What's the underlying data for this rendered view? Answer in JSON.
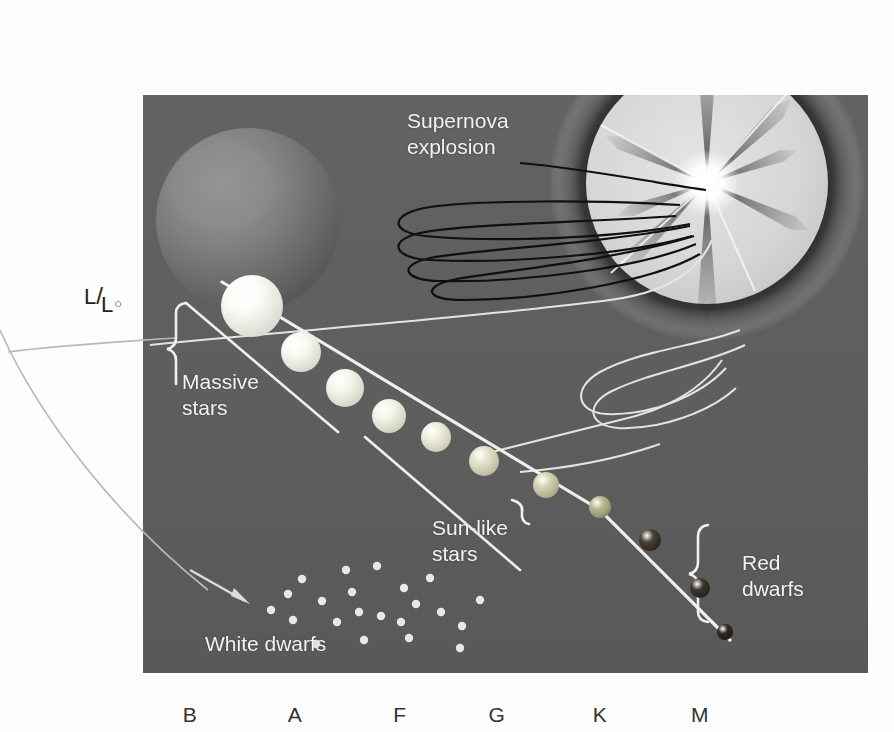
{
  "figure": {
    "kind": "hertzsprung-russell-diagram",
    "panel": {
      "bg_color": "#5d5d5d",
      "x": 143,
      "y": 95,
      "width": 725,
      "height": 578
    },
    "page_bg": "#fdfdfd"
  },
  "axes": {
    "y_label": {
      "numerator": "L",
      "slash": "/",
      "denominator": "L",
      "sun_symbol": "○"
    },
    "x_ticks": [
      {
        "label": "B",
        "x": 190
      },
      {
        "label": "A",
        "x": 295
      },
      {
        "label": "F",
        "x": 400
      },
      {
        "label": "G",
        "x": 497
      },
      {
        "label": "K",
        "x": 600
      },
      {
        "label": "M",
        "x": 700
      }
    ],
    "x_tick_y": 703
  },
  "labels": {
    "supernova": {
      "text": "Supernova\nexplosion",
      "x": 407,
      "y": 108,
      "color": "#ececec"
    },
    "massive_stars": {
      "text": "Massive\nstars",
      "x": 182,
      "y": 369,
      "color": "#f0f0f0"
    },
    "sunlike_stars": {
      "text": "Sun-like\nstars",
      "x": 432,
      "y": 515,
      "color": "#f2f2f2"
    },
    "red_dwarfs": {
      "text": "Red\ndwarfs",
      "x": 742,
      "y": 550,
      "color": "#f2f2f2"
    },
    "white_dwarfs": {
      "text": "White dwarfs",
      "x": 205,
      "y": 631,
      "color": "#f2f2f2"
    }
  },
  "main_sequence": {
    "description": "Chain of main-sequence stars descending from hot blue-white (B) to cool red (M)",
    "stars": [
      {
        "name": "massive-star-1",
        "cx": 252,
        "cy": 306,
        "r": 31,
        "fill": "#fbfbf6",
        "rim": "#d6d6cc"
      },
      {
        "name": "massive-star-2",
        "cx": 301,
        "cy": 352,
        "r": 20,
        "fill": "#f9f9f2",
        "rim": "#d2d2c6"
      },
      {
        "name": "massive-star-3",
        "cx": 345,
        "cy": 388,
        "r": 19,
        "fill": "#f5f5ec",
        "rim": "#cfcfc2"
      },
      {
        "name": "sunlike-star-1",
        "cx": 389,
        "cy": 416,
        "r": 17,
        "fill": "#f3f3e6",
        "rim": "#cbcbba"
      },
      {
        "name": "sunlike-star-2",
        "cx": 436,
        "cy": 437,
        "r": 15,
        "fill": "#eeeedc",
        "rim": "#c4c4ae"
      },
      {
        "name": "sunlike-star-3",
        "cx": 484,
        "cy": 461,
        "r": 15,
        "fill": "#e2e2c8",
        "rim": "#b5b59a"
      },
      {
        "name": "sunlike-star-4",
        "cx": 546,
        "cy": 485,
        "r": 13,
        "fill": "#d3d3b2",
        "rim": "#a4a483"
      },
      {
        "name": "sunlike-star-5",
        "cx": 600,
        "cy": 507,
        "r": 11,
        "fill": "#b9b98f",
        "rim": "#87876a"
      },
      {
        "name": "red-dwarf-1",
        "cx": 650,
        "cy": 540,
        "r": 11,
        "fill": "#494036",
        "rim": "#2a241e"
      },
      {
        "name": "red-dwarf-2",
        "cx": 700,
        "cy": 588,
        "r": 10,
        "fill": "#3e362c",
        "rim": "#241f19"
      },
      {
        "name": "red-dwarf-3",
        "cx": 725,
        "cy": 632,
        "r": 8,
        "fill": "#302a22",
        "rim": "#1c1813"
      }
    ]
  },
  "giants": {
    "red_giant": {
      "name": "red-giant-sphere",
      "cx": 248,
      "cy": 220,
      "r": 92,
      "fill": "#7b7b7b",
      "rim": "#575757"
    },
    "supernova": {
      "name": "supernova-burst",
      "cx": 707,
      "cy": 183,
      "halo_r": 158,
      "core_r": 122,
      "disc_fill": "#d8d8d8",
      "glow_color": "#2a2a2a",
      "ray_count": 8
    }
  },
  "white_dwarfs": {
    "dot_color": "#e8e8e8",
    "dots": [
      [
        302,
        579
      ],
      [
        377,
        566
      ],
      [
        322,
        601
      ],
      [
        352,
        592
      ],
      [
        404,
        588
      ],
      [
        416,
        604
      ],
      [
        271,
        610
      ],
      [
        293,
        620
      ],
      [
        337,
        622
      ],
      [
        381,
        616
      ],
      [
        441,
        612
      ],
      [
        316,
        644
      ],
      [
        364,
        640
      ],
      [
        409,
        638
      ],
      [
        462,
        626
      ],
      [
        480,
        600
      ],
      [
        430,
        578
      ],
      [
        359,
        612
      ],
      [
        288,
        594
      ],
      [
        401,
        622
      ],
      [
        346,
        570
      ],
      [
        460,
        648
      ]
    ]
  },
  "tracks": {
    "color_light": "#e6e6e6",
    "color_dark": "#111111",
    "description": "Evolutionary tracks: main-sequence line, giant-branch loops, white-dwarf arrow"
  },
  "brackets": [
    {
      "name": "massive-stars-bracket"
    },
    {
      "name": "sunlike-stars-bracket"
    },
    {
      "name": "red-dwarfs-bracket"
    }
  ]
}
